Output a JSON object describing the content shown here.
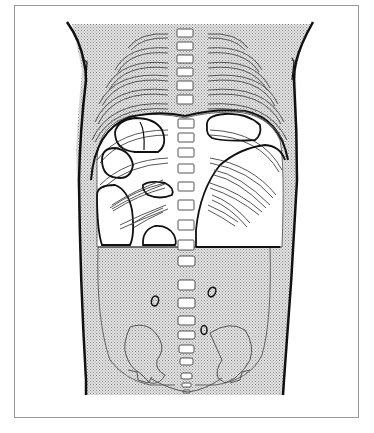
{
  "figure": {
    "type": "anatomical-diagram",
    "highlighted_region": "upper-abdomen",
    "colors": {
      "frame_border": "#9a9a9a",
      "outline": "#111111",
      "bone_line": "#555555",
      "shading": "#c8c8c8",
      "highlight_fill": "#ffffff"
    },
    "structures": {
      "body_outline": "torso silhouette",
      "spine": {
        "vertebrae_count": 22
      },
      "ribs": {
        "per_side": 10
      },
      "pelvis": "iliac wings and sacrum",
      "highlight_box": "white upper-abdominal region",
      "left_organs": 5,
      "right_organs": 2,
      "small_ovals": 3
    }
  }
}
